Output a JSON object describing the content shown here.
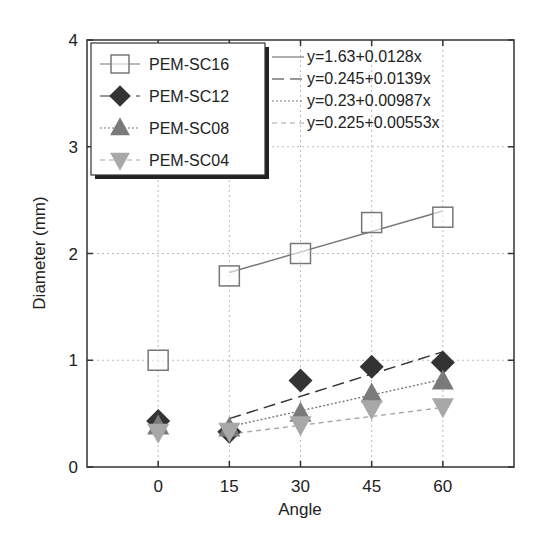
{
  "chart_data": {
    "type": "scatter",
    "title": "",
    "xlabel": "Angle",
    "ylabel": "Diameter (mm)",
    "xlim": [
      -15,
      75
    ],
    "ylim": [
      0,
      4
    ],
    "xticks": [
      0,
      15,
      30,
      45,
      60
    ],
    "yticks": [
      0,
      1,
      2,
      3,
      4
    ],
    "grid": true,
    "legend_position": "upper left",
    "x": [
      0,
      15,
      30,
      45,
      60
    ],
    "series": [
      {
        "name": "PEM-SC16",
        "marker": "square-open",
        "color": "#777777",
        "values": [
          1.0,
          1.79,
          2.0,
          2.29,
          2.34
        ],
        "fit": {
          "label": "y=1.63+0.0128x",
          "intercept": 1.63,
          "slope": 0.0128,
          "x_range": [
            15,
            60
          ],
          "dash": "solid"
        }
      },
      {
        "name": "PEM-SC12",
        "marker": "diamond",
        "color": "#333333",
        "values": [
          0.43,
          0.33,
          0.81,
          0.94,
          0.98
        ],
        "fit": {
          "label": "y=0.245+0.0139x",
          "intercept": 0.245,
          "slope": 0.0139,
          "x_range": [
            15,
            60
          ],
          "dash": "long-dash"
        }
      },
      {
        "name": "PEM-SC08",
        "marker": "triangle-up",
        "color": "#7a7a7a",
        "values": [
          0.38,
          0.36,
          0.5,
          0.68,
          0.8
        ],
        "fit": {
          "label": "y=0.23+0.00987x",
          "intercept": 0.23,
          "slope": 0.00987,
          "x_range": [
            15,
            60
          ],
          "dash": "dotted"
        }
      },
      {
        "name": "PEM-SC04",
        "marker": "triangle-down",
        "color": "#a8a8a8",
        "values": [
          0.33,
          0.34,
          0.4,
          0.55,
          0.57
        ],
        "fit": {
          "label": "y=0.225+0.00553x",
          "intercept": 0.225,
          "slope": 0.00553,
          "x_range": [
            15,
            60
          ],
          "dash": "dashed"
        }
      }
    ]
  }
}
